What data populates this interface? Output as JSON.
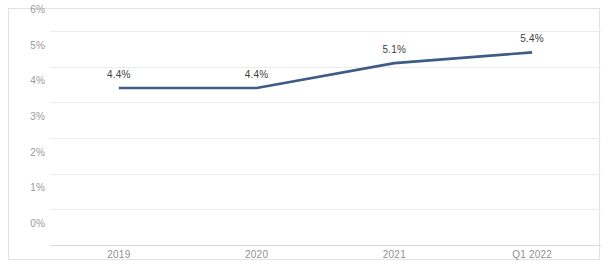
{
  "chart_data": {
    "type": "line",
    "title": "",
    "subtitle": "",
    "xlabel": "",
    "ylabel": "",
    "categories": [
      "2019",
      "2020",
      "2021",
      "Q1 2022"
    ],
    "series": [
      {
        "name": "",
        "values": [
          4.4,
          4.4,
          5.1,
          5.4
        ],
        "color": "#3F5C86"
      }
    ],
    "data_labels": [
      "4.4%",
      "4.4%",
      "5.1%",
      "5.4%"
    ],
    "ylim": [
      0,
      6
    ],
    "ytick_values": [
      0,
      1,
      2,
      3,
      4,
      5,
      6
    ],
    "ytick_labels": [
      "0%",
      "1%",
      "2%",
      "3%",
      "4%",
      "5%",
      "6%"
    ],
    "grid": true,
    "grid_axis": "y",
    "legend": false,
    "legend_position": "none",
    "markers": false,
    "line_width": 2.6,
    "axis_line_color": "#dadada",
    "gridline_color": "#ececec",
    "tick_label_color": "#9a9a9a",
    "data_label_color": "#404040",
    "plot_background": "#ffffff",
    "frame_border_color": "#e2e2e2"
  }
}
